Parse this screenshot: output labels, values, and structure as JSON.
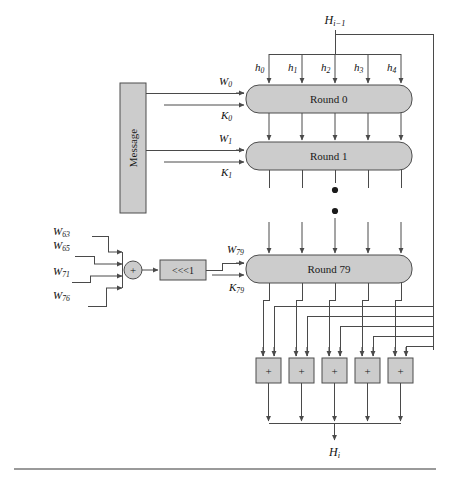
{
  "figure": {
    "colors": {
      "block_fill": "#cccccc",
      "block_stroke": "#4d4d4d",
      "line": "#4a4a4a",
      "text": "#1a1a1a",
      "background": "#ffffff",
      "rule": "#9a9a9a"
    }
  },
  "inputs": {
    "chaining_input": "H",
    "chaining_input_sub": "i−1",
    "state_words": [
      {
        "name": "h",
        "sub": "0"
      },
      {
        "name": "h",
        "sub": "1"
      },
      {
        "name": "h",
        "sub": "2"
      },
      {
        "name": "h",
        "sub": "3"
      },
      {
        "name": "h",
        "sub": "4"
      }
    ]
  },
  "message_block": {
    "label": "Message"
  },
  "rounds": [
    {
      "label": "Round 0",
      "w": {
        "name": "W",
        "sub": "0"
      },
      "k": {
        "name": "K",
        "sub": "0"
      }
    },
    {
      "label": "Round 1",
      "w": {
        "name": "W",
        "sub": "1"
      },
      "k": {
        "name": "K",
        "sub": "1"
      }
    },
    {
      "label": "Round 79",
      "w": {
        "name": "W",
        "sub": "79"
      },
      "k": {
        "name": "K",
        "sub": "79"
      }
    }
  ],
  "ellipsis": {
    "dots": 2
  },
  "expansion": {
    "taps": [
      {
        "name": "W",
        "sub": "63"
      },
      {
        "name": "W",
        "sub": "65"
      },
      {
        "name": "W",
        "sub": "71"
      },
      {
        "name": "W",
        "sub": "76"
      }
    ],
    "xor_symbol": "+",
    "rotate_label": "<<<1"
  },
  "adders": {
    "count": 5,
    "symbol": "+"
  },
  "output": {
    "chaining_output": "H",
    "chaining_output_sub": "i"
  }
}
